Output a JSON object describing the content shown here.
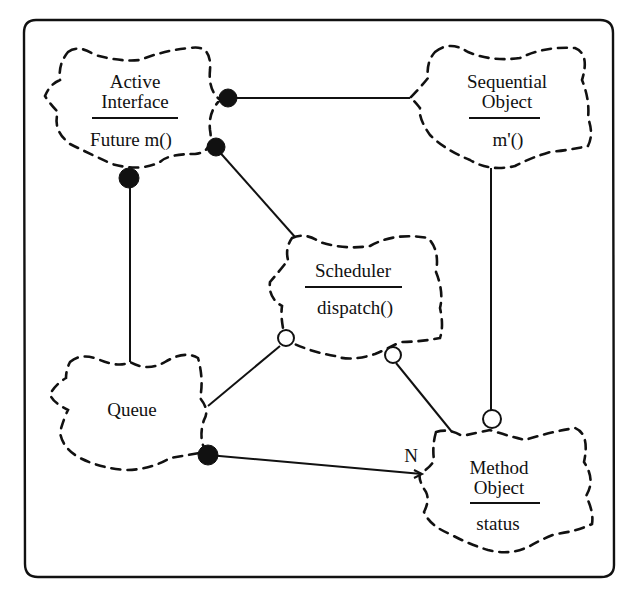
{
  "diagram": {
    "type": "class-diagram",
    "style": "Booch notation (cloud-shaped classes)",
    "nodes": [
      {
        "id": "active-interface",
        "name_lines": [
          "Active",
          "Interface"
        ],
        "members": [
          "Future m()"
        ]
      },
      {
        "id": "sequential-object",
        "name_lines": [
          "Sequential",
          "Object"
        ],
        "members": [
          "m'()"
        ]
      },
      {
        "id": "scheduler",
        "name_lines": [
          "Scheduler"
        ],
        "members": [
          "dispatch()"
        ]
      },
      {
        "id": "queue",
        "name_lines": [
          "Queue"
        ],
        "members": []
      },
      {
        "id": "method-object",
        "name_lines": [
          "Method",
          "Object"
        ],
        "members": [
          "status"
        ]
      }
    ],
    "edges": [
      {
        "from": "active-interface",
        "to": "sequential-object",
        "end_at_from": "filled-dot"
      },
      {
        "from": "active-interface",
        "to": "scheduler",
        "end_at_from": "filled-dot"
      },
      {
        "from": "active-interface",
        "to": "queue",
        "end_at_from": "filled-dot"
      },
      {
        "from": "scheduler",
        "to": "queue",
        "end_at_from": "hollow-dot"
      },
      {
        "from": "scheduler",
        "to": "method-object",
        "end_at_from": "hollow-dot"
      },
      {
        "from": "sequential-object",
        "to": "method-object",
        "end_at_to": "hollow-dot"
      },
      {
        "from": "queue",
        "to": "method-object",
        "end_at_from": "filled-dot",
        "multiplicity": "N"
      }
    ]
  },
  "labels": {
    "active_interface_1": "Active",
    "active_interface_2": "Interface",
    "active_interface_member": "Future m()",
    "sequential_object_1": "Sequential",
    "sequential_object_2": "Object",
    "sequential_object_member": "m'()",
    "scheduler_name": "Scheduler",
    "scheduler_member": "dispatch()",
    "queue_name": "Queue",
    "method_object_1": "Method",
    "method_object_2": "Object",
    "method_object_member": "status",
    "multiplicity_n": "N"
  }
}
